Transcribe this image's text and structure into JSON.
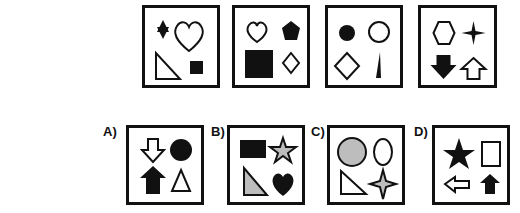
{
  "question_row": [
    {
      "shapes": [
        "star-of-david-filled",
        "heart-outline",
        "right-triangle-outline",
        "square-filled"
      ]
    },
    {
      "shapes": [
        "heart-outline",
        "pentagon-filled",
        "square-filled",
        "diamond-outline"
      ]
    },
    {
      "shapes": [
        "circle-filled",
        "circle-outline",
        "diamond-outline",
        "thin-triangle-filled"
      ]
    },
    {
      "shapes": [
        "hexagon-outline",
        "four-point-star-filled",
        "arrow-down-filled",
        "arrow-up-outline"
      ]
    }
  ],
  "answers": [
    {
      "label": "A)",
      "shapes": [
        "arrow-down-outline",
        "circle-filled",
        "arrow-up-filled",
        "triangle-outline"
      ]
    },
    {
      "label": "B)",
      "shapes": [
        "rectangle-filled",
        "star-gray",
        "right-triangle-gray",
        "heart-filled"
      ]
    },
    {
      "label": "C)",
      "shapes": [
        "circle-gray",
        "ellipse-outline",
        "right-triangle-outline",
        "four-point-star-gray"
      ]
    },
    {
      "label": "D)",
      "shapes": [
        "star-filled",
        "rectangle-outline",
        "arrow-left-outline",
        "arrow-up-filled"
      ]
    }
  ],
  "colors": {
    "ink": "#111111",
    "gray": "#bdbdbd"
  }
}
